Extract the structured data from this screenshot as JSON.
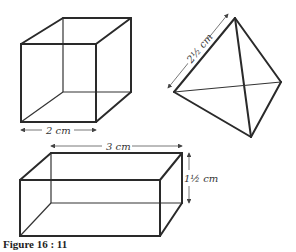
{
  "figure": {
    "caption": "Figure 16 : 11",
    "shapes": [
      {
        "name": "cube",
        "dimension_label": "2 cm"
      },
      {
        "name": "tetrahedron",
        "dimension_label": "2½ cm"
      },
      {
        "name": "cuboid",
        "length_label": "3 cm",
        "height_label": "1½ cm"
      }
    ]
  }
}
